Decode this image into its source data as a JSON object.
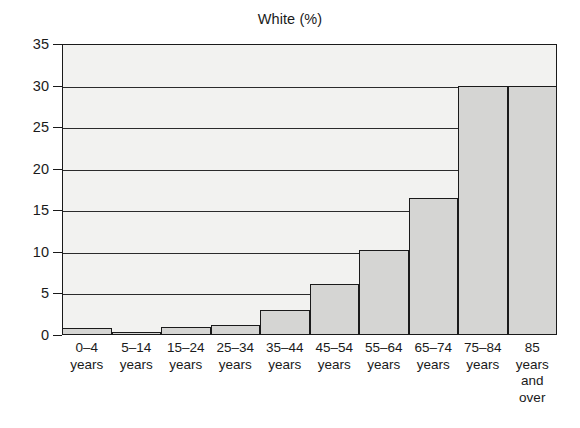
{
  "chart_data": {
    "type": "bar",
    "title": "White (%)",
    "xlabel": "",
    "ylabel": "",
    "ylim": [
      0,
      35
    ],
    "yticks": [
      0,
      5,
      10,
      15,
      20,
      25,
      30,
      35
    ],
    "grid": true,
    "legend": false,
    "categories": [
      "0–4 years",
      "5–14 years",
      "15–24 years",
      "25–34 years",
      "35–44 years",
      "45–54 years",
      "55–64 years",
      "65–74 years",
      "75–84 years",
      "85 years and over"
    ],
    "category_lines": [
      [
        "0–4",
        "years"
      ],
      [
        "5–14",
        "years"
      ],
      [
        "15–24",
        "years"
      ],
      [
        "25–34",
        "years"
      ],
      [
        "35–44",
        "years"
      ],
      [
        "45–54",
        "years"
      ],
      [
        "55–64",
        "years"
      ],
      [
        "65–74",
        "years"
      ],
      [
        "75–84",
        "years"
      ],
      [
        "85",
        "years",
        "and",
        "over"
      ]
    ],
    "values": [
      0.8,
      0.2,
      1.0,
      1.2,
      3.0,
      6.1,
      10.2,
      16.5,
      30.0,
      30.0
    ],
    "colors": {
      "bar_fill": "#d5d5d3",
      "bar_edge": "#1a1a1a",
      "plot_background": "#f2f2f0",
      "grid": "#2b2b2b",
      "text": "#1a1a1a",
      "page_background": "#ffffff"
    }
  }
}
